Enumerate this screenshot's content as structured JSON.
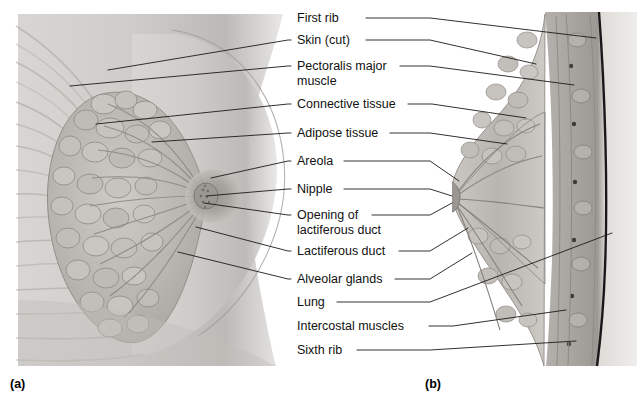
{
  "figure": {
    "background_color": "#ffffff",
    "text_color": "#111111",
    "leader_line_color": "#1b1b1b"
  },
  "captions": [
    {
      "id": "caption-a",
      "text": "(a)",
      "x": 10,
      "y": 388
    },
    {
      "id": "caption-b",
      "text": "(b)",
      "x": 425,
      "y": 388
    }
  ],
  "panels": [
    {
      "id": "panel-a",
      "caption": "(a)",
      "view": "anterior view, partially dissected breast",
      "x": 14,
      "y": 12,
      "width": 278,
      "height": 355
    },
    {
      "id": "panel-b",
      "caption": "(b)",
      "view": "sagittal section of breast and chest wall",
      "x": 455,
      "y": 10,
      "width": 180,
      "height": 358
    }
  ],
  "labels": [
    {
      "id": "first-rib",
      "lines": [
        "First rib"
      ],
      "x": 297,
      "y": 22,
      "text_end": 362,
      "left_leader": false,
      "right_leader": true,
      "target_b": {
        "x": 596,
        "y": 38
      }
    },
    {
      "id": "skin-cut",
      "lines": [
        "Skin (cut)"
      ],
      "x": 297,
      "y": 44,
      "text_end": 362,
      "left_leader": true,
      "right_leader": true,
      "target_a": {
        "x": 108,
        "y": 70
      },
      "target_b": {
        "x": 536,
        "y": 64
      }
    },
    {
      "id": "pectoralis-major",
      "lines": [
        "Pectoralis major",
        "muscle"
      ],
      "x": 297,
      "y": 70,
      "text_end": 396,
      "left_leader": true,
      "right_leader": true,
      "target_a": {
        "x": 70,
        "y": 86
      },
      "target_b": {
        "x": 574,
        "y": 85
      }
    },
    {
      "id": "connective-tissue",
      "lines": [
        "Connective tissue"
      ],
      "x": 297,
      "y": 108,
      "text_end": 404,
      "left_leader": true,
      "right_leader": true,
      "target_a": {
        "x": 96,
        "y": 124
      },
      "target_b": {
        "x": 526,
        "y": 118
      }
    },
    {
      "id": "adipose-tissue",
      "lines": [
        "Adipose tissue"
      ],
      "x": 297,
      "y": 137,
      "text_end": 386,
      "left_leader": true,
      "right_leader": true,
      "target_a": {
        "x": 152,
        "y": 142
      },
      "target_b": {
        "x": 507,
        "y": 144
      }
    },
    {
      "id": "areola",
      "lines": [
        "Areola"
      ],
      "x": 297,
      "y": 165,
      "text_end": 340,
      "left_leader": true,
      "right_leader": true,
      "target_a": {
        "x": 211,
        "y": 178
      },
      "target_b": {
        "x": 459,
        "y": 181
      }
    },
    {
      "id": "nipple",
      "lines": [
        "Nipple"
      ],
      "x": 297,
      "y": 193,
      "text_end": 340,
      "left_leader": true,
      "right_leader": true,
      "target_a": {
        "x": 206,
        "y": 196
      },
      "target_b": {
        "x": 452,
        "y": 196
      }
    },
    {
      "id": "opening-of-lactiferous-duct",
      "lines": [
        "Opening of",
        "lactiferous duct"
      ],
      "x": 297,
      "y": 219,
      "text_end": 368,
      "left_leader": true,
      "right_leader": true,
      "target_a": {
        "x": 204,
        "y": 203
      },
      "target_b": {
        "x": 452,
        "y": 203
      }
    },
    {
      "id": "lactiferous-duct",
      "lines": [
        "Lactiferous duct"
      ],
      "x": 297,
      "y": 255,
      "text_end": 395,
      "left_leader": true,
      "right_leader": true,
      "target_a": {
        "x": 196,
        "y": 227
      },
      "target_b": {
        "x": 468,
        "y": 228
      }
    },
    {
      "id": "alveolar-glands",
      "lines": [
        "Alveolar glands"
      ],
      "x": 297,
      "y": 283,
      "text_end": 391,
      "left_leader": true,
      "right_leader": true,
      "target_a": {
        "x": 178,
        "y": 252
      },
      "target_b": {
        "x": 472,
        "y": 253
      }
    },
    {
      "id": "lung",
      "lines": [
        "Lung"
      ],
      "x": 297,
      "y": 306,
      "text_end": 333,
      "left_leader": false,
      "right_leader": true,
      "target_b": {
        "x": 612,
        "y": 233
      }
    },
    {
      "id": "intercostal-muscles",
      "lines": [
        "Intercostal muscles"
      ],
      "x": 297,
      "y": 330,
      "text_end": 425,
      "left_leader": false,
      "right_leader": true,
      "target_b": {
        "x": 566,
        "y": 310
      }
    },
    {
      "id": "sixth-rib",
      "lines": [
        "Sixth rib"
      ],
      "x": 297,
      "y": 354,
      "text_end": 353,
      "left_leader": false,
      "right_leader": true,
      "target_b": {
        "x": 576,
        "y": 341
      }
    }
  ]
}
